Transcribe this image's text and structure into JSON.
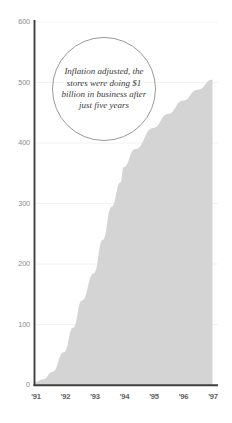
{
  "chart_data": {
    "type": "area",
    "title": "",
    "subtitle": "",
    "xlabel": "",
    "ylabel": "",
    "grid": true,
    "legend_position": "none",
    "series_color": "#d4d4d4",
    "axis_color": "#3f3f3f",
    "gridline_color": "#f2f2f2",
    "annotation_border_color": "#9a9a9a",
    "xlim": [
      "'91",
      "'97"
    ],
    "ylim": [
      0,
      600
    ],
    "y_ticks": [
      600,
      500,
      400,
      300,
      200,
      100,
      0
    ],
    "y_tick_labels": [
      "600",
      "500",
      "400",
      "300",
      "200",
      "100",
      "0"
    ],
    "x_ticks": [
      "'91",
      "'92",
      "'93",
      "'94",
      "'95",
      "'96",
      "'97"
    ],
    "x": [
      "'91",
      "'92",
      "'93",
      "'94",
      "'95",
      "'96",
      "'97"
    ],
    "series": [
      {
        "name": "Sales",
        "values": [
          5,
          55,
          185,
          360,
          425,
          470,
          505
        ]
      }
    ],
    "detailed_points": [
      {
        "x": "'91",
        "y": 5
      },
      {
        "x": "'91.3",
        "y": 10
      },
      {
        "x": "'91.6",
        "y": 22
      },
      {
        "x": "'92",
        "y": 55
      },
      {
        "x": "'92.3",
        "y": 95
      },
      {
        "x": "'92.6",
        "y": 140
      },
      {
        "x": "'93",
        "y": 185
      },
      {
        "x": "'93.3",
        "y": 240
      },
      {
        "x": "'93.6",
        "y": 295
      },
      {
        "x": "'93.9",
        "y": 335
      },
      {
        "x": "'94",
        "y": 360
      },
      {
        "x": "'94.4",
        "y": 390
      },
      {
        "x": "'95",
        "y": 425
      },
      {
        "x": "'95.5",
        "y": 448
      },
      {
        "x": "'96",
        "y": 470
      },
      {
        "x": "'96.5",
        "y": 488
      },
      {
        "x": "'97",
        "y": 505
      }
    ],
    "annotations": [
      {
        "shape": "circle",
        "text": "Inflation adjusted, the stores were doing $1 billion in business after just five years",
        "lines": [
          "Inflation",
          "adjusted, the",
          "stores were",
          "doing $1 billion",
          "in business after",
          "just five",
          "years"
        ]
      }
    ]
  },
  "axes": {
    "y_labels": [
      "600",
      "500",
      "400",
      "300",
      "200",
      "100",
      "0"
    ],
    "x_labels": [
      "'91",
      "'92",
      "'93",
      "'94",
      "'95",
      "'96",
      "'97"
    ]
  },
  "annotation": {
    "text": "Inflation adjusted, the stores were doing $1 billion in business after just five years"
  }
}
